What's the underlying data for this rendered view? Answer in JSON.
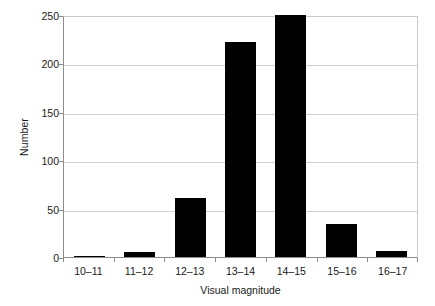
{
  "chart_data": {
    "type": "bar",
    "title": "",
    "subtitle": "",
    "xlabel": "Visual magnitude",
    "ylabel": "Number",
    "categories": [
      "10–11",
      "11–12",
      "12–13",
      "13–14",
      "14–15",
      "15–16",
      "16–17"
    ],
    "values": [
      1,
      5,
      61,
      222,
      250,
      34,
      6
    ],
    "series": [
      {
        "name": "Number",
        "values": [
          1,
          5,
          61,
          222,
          250,
          34,
          6
        ]
      }
    ],
    "ylim": [
      0,
      250
    ],
    "yticks": [
      0,
      50,
      100,
      150,
      200,
      250
    ],
    "ytick_labels": [
      "0",
      "50",
      "100",
      "150",
      "200",
      "250"
    ],
    "grid": "horizontal",
    "legend": "none",
    "bar_color": "#000000",
    "grid_color": "#cfcfcf",
    "axis_color": "#8c8c8c",
    "background_color": "#ffffff"
  }
}
